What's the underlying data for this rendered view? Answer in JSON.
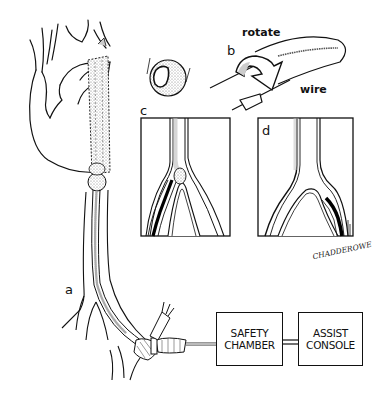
{
  "figure": {
    "panels": [
      {
        "id": "a",
        "label": "a",
        "description": "heart with catheter through aorta and femoral artery"
      },
      {
        "id": "b",
        "label": "b",
        "description": "rotating wire inside catheter"
      },
      {
        "id": "c",
        "label": "c",
        "description": "vessel bifurcation with wire in left branch"
      },
      {
        "id": "d",
        "label": "d",
        "description": "vessel bifurcation with wire in right branch"
      }
    ],
    "annotations": {
      "rotate": "rotate",
      "wire": "wire"
    },
    "blocks": {
      "safety_chamber": "SAFETY\nCHAMBER",
      "assist_console": "ASSIST\nCONSOLE"
    },
    "signature": "CHADDEROWE"
  }
}
